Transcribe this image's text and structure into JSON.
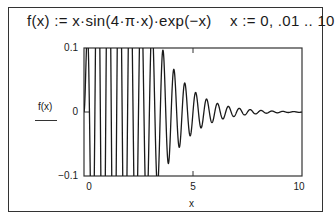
{
  "header": {
    "definition": "f(x) := x·sin(4·π·x)·exp(−x)",
    "range": "x := 0, .01 .. 10"
  },
  "chart_data": {
    "type": "line",
    "title": "f(x) := x·sin(4·π·x)·exp(−x)",
    "function": "x*sin(4*pi*x)*exp(-x)",
    "x_range": {
      "start": 0,
      "step": 0.01,
      "end": 10
    },
    "xlabel": "x",
    "ylabel": "f(x)",
    "xlim": [
      0,
      10
    ],
    "ylim": [
      -0.1,
      0.1
    ],
    "x_ticks": [
      "0",
      "5",
      "10"
    ],
    "y_ticks": [
      "0.1",
      "0",
      "−0.1"
    ],
    "grid": false,
    "legend": null,
    "series": [
      {
        "name": "f(x)",
        "color": "#1a1a1a"
      }
    ]
  },
  "axes": {
    "ylabel": "f(x)",
    "xlabel": "x",
    "y_ticks": {
      "top": "0.1",
      "mid": "0",
      "bottom": "−0.1"
    },
    "x_ticks": {
      "left": "0",
      "mid": "5",
      "right": "10"
    }
  }
}
